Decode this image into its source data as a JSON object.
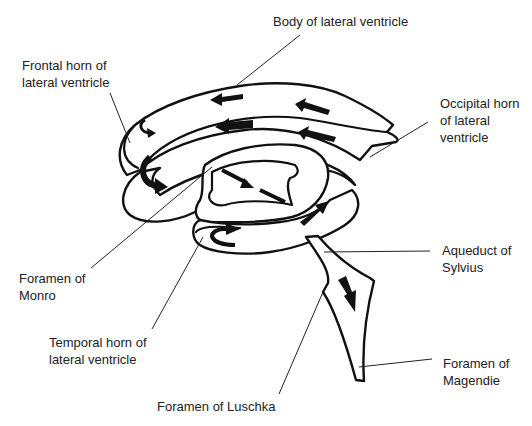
{
  "diagram": {
    "labels": {
      "body": "Body of lateral ventricle",
      "frontal": "Frontal horn of\nlateral ventricle",
      "occipital": "Occipital horn\nof lateral\nventricle",
      "monro": "Foramen of\nMonro",
      "aqueduct": "Aqueduct of\nSylvius",
      "temporal": "Temporal horn of\nlateral ventricle",
      "magendie": "Foramen of\nMagendie",
      "luschka": "Foramen of Luschka"
    },
    "colors": {
      "stroke": "#111111",
      "text": "#222222",
      "background": "#ffffff"
    },
    "arrow_icons": [
      "arrow-left-upper-body",
      "arrow-left-lower-body",
      "arrow-left-occipital-upper",
      "arrow-left-occipital-lower",
      "curved-arrow-frontal-small",
      "curved-arrow-frontal-large",
      "arrow-dashed-monro",
      "arrow-up-right-third-ventricle",
      "curved-arrow-temporal",
      "arrow-down-aqueduct"
    ]
  }
}
